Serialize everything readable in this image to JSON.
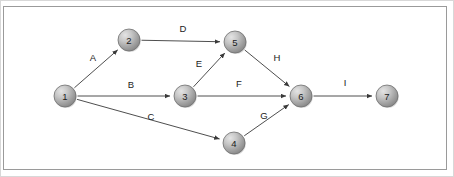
{
  "diagram": {
    "type": "directed-graph",
    "title": "",
    "canvas": {
      "width": 454,
      "height": 177
    },
    "frame": {
      "border_color": "#9a9a9a",
      "background": "#ffffff"
    },
    "node_style": {
      "shape": "sphere",
      "radius": 11,
      "fill_light": "#d9d9d9",
      "fill_dark": "#8e8e8e",
      "stroke": "#6f6f6f",
      "label_color": "#1b1b1b"
    },
    "edge_style": {
      "stroke": "#3a3a3a",
      "arrowhead": "filled-triangle",
      "label_color": "#222222"
    },
    "nodes": [
      {
        "id": "1",
        "label": "1",
        "x": 65,
        "y": 96
      },
      {
        "id": "2",
        "label": "2",
        "x": 129,
        "y": 40
      },
      {
        "id": "3",
        "label": "3",
        "x": 185,
        "y": 96
      },
      {
        "id": "4",
        "label": "4",
        "x": 234,
        "y": 143
      },
      {
        "id": "5",
        "label": "5",
        "x": 235,
        "y": 42
      },
      {
        "id": "6",
        "label": "6",
        "x": 301,
        "y": 96
      },
      {
        "id": "7",
        "label": "7",
        "x": 387,
        "y": 96
      }
    ],
    "edges": [
      {
        "id": "A",
        "label": "A",
        "from": "1",
        "to": "2",
        "label_x": 93,
        "label_y": 58
      },
      {
        "id": "B",
        "label": "B",
        "from": "1",
        "to": "3",
        "label_x": 131,
        "label_y": 85
      },
      {
        "id": "C",
        "label": "C",
        "from": "1",
        "to": "4",
        "label_x": 151,
        "label_y": 117
      },
      {
        "id": "D",
        "label": "D",
        "from": "2",
        "to": "5",
        "label_x": 183,
        "label_y": 29
      },
      {
        "id": "E",
        "label": "E",
        "from": "3",
        "to": "5",
        "label_x": 199,
        "label_y": 64
      },
      {
        "id": "F",
        "label": "F",
        "from": "3",
        "to": "6",
        "label_x": 239,
        "label_y": 84
      },
      {
        "id": "G",
        "label": "G",
        "from": "4",
        "to": "6",
        "label_x": 264,
        "label_y": 116
      },
      {
        "id": "H",
        "label": "H",
        "from": "5",
        "to": "6",
        "label_x": 277,
        "label_y": 58
      },
      {
        "id": "I",
        "label": "I",
        "from": "6",
        "to": "7",
        "label_x": 345,
        "label_y": 83
      }
    ]
  }
}
